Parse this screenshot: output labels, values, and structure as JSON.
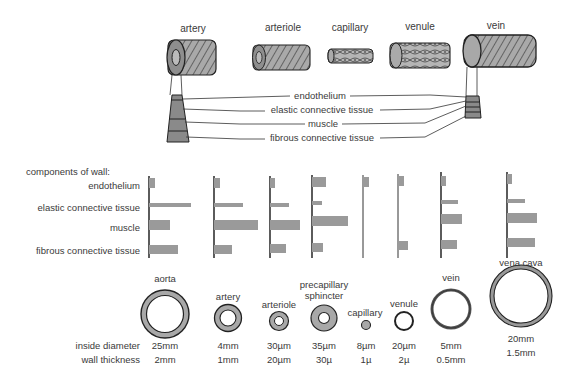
{
  "vessels_top": {
    "labels": [
      "artery",
      "arteriole",
      "capillary",
      "venule",
      "vein"
    ]
  },
  "wall_layers": {
    "labels": [
      "endothelium",
      "elastic connective tissue",
      "muscle",
      "fibrous connective tissue"
    ]
  },
  "components": {
    "heading": "components of wall:",
    "rows": [
      "endothelium",
      "elastic connective tissue",
      "muscle",
      "fibrous connective tissue"
    ]
  },
  "cross_sections": [
    {
      "name": "aorta",
      "diameter": "25mm",
      "thickness": "2mm"
    },
    {
      "name": "artery",
      "diameter": "4mm",
      "thickness": "1mm"
    },
    {
      "name": "arteriole",
      "diameter": "30µm",
      "thickness": "20µm"
    },
    {
      "name": "precapillary",
      "name2": "sphincter",
      "diameter": "35µm",
      "thickness": "30µ"
    },
    {
      "name": "capillary",
      "diameter": "8µm",
      "thickness": "1µ"
    },
    {
      "name": "venule",
      "diameter": "20µm",
      "thickness": "2µ"
    },
    {
      "name": "vein",
      "diameter": "5mm",
      "thickness": "0.5mm"
    },
    {
      "name": "vena cava",
      "diameter": "20mm",
      "thickness": "1.5mm"
    }
  ],
  "row_labels": {
    "diameter": "inside diameter",
    "thickness": "wall thickness"
  },
  "colors": {
    "bar": "#9a9a9a",
    "wall_fill": "#a8a8a8",
    "line": "#333333"
  },
  "chart_data": {
    "type": "bar",
    "orientation": "horizontal",
    "title": "components of wall:",
    "categories": [
      "endothelium",
      "elastic connective tissue",
      "muscle",
      "fibrous connective tissue"
    ],
    "series": [
      {
        "name": "aorta",
        "values": [
          6,
          42,
          21,
          29
        ]
      },
      {
        "name": "artery",
        "values": [
          6,
          29,
          44,
          18
        ]
      },
      {
        "name": "arteriole",
        "values": [
          5,
          19,
          30,
          16
        ]
      },
      {
        "name": "precapillary sphincter",
        "values": [
          14,
          10,
          36,
          11
        ]
      },
      {
        "name": "capillary",
        "values": [
          6,
          0,
          0,
          0
        ]
      },
      {
        "name": "venule",
        "values": [
          6,
          0,
          0,
          10
        ]
      },
      {
        "name": "vein",
        "values": [
          5,
          17,
          21,
          16
        ]
      },
      {
        "name": "vena cava",
        "values": [
          5,
          18,
          30,
          28
        ]
      }
    ],
    "xlabel": "",
    "ylabel": "",
    "grid": false,
    "legend": "none"
  }
}
